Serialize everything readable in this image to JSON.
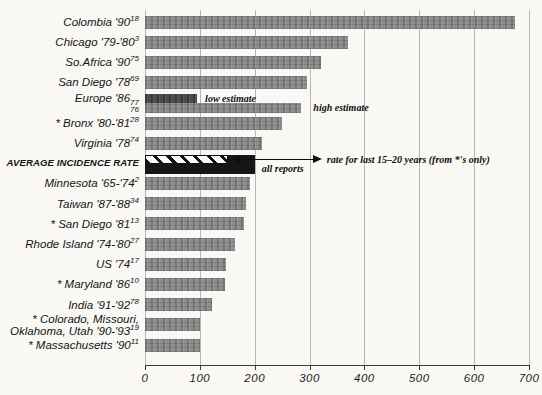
{
  "chart_data": {
    "type": "bar",
    "orientation": "horizontal",
    "title": "",
    "xlabel": "",
    "ylabel": "",
    "axis": {
      "min": 0,
      "max": 700,
      "ticks": [
        "0",
        "100",
        "200",
        "300",
        "400",
        "500",
        "600",
        "700"
      ],
      "grid": true
    },
    "rows": [
      {
        "label": "Colombia '90",
        "sup": "18",
        "value": 675,
        "style": "normal"
      },
      {
        "label": "Chicago '79-'80",
        "sup": "3",
        "value": 370,
        "style": "normal"
      },
      {
        "label": "So.Africa '90",
        "sup": "75",
        "value": 320,
        "style": "normal"
      },
      {
        "label": "San Diego '78",
        "sup": "69",
        "value": 295,
        "style": "normal"
      },
      {
        "label": "Europe '86",
        "sup": "77",
        "sub": "76",
        "bars": [
          {
            "name": "low estimate",
            "value": 95,
            "style": "dark"
          },
          {
            "name": "high estimate",
            "value": 285,
            "style": "normal"
          }
        ]
      },
      {
        "label": "* Bronx '80-'81",
        "sup": "28",
        "value": 250,
        "style": "normal"
      },
      {
        "label": "Virginia '78",
        "sup": "74",
        "value": 213,
        "style": "normal"
      },
      {
        "label": "AVERAGE INCIDENCE RATE",
        "emphasis": true,
        "bars": [
          {
            "name": "rate for last 15–20 years (from *'s only)",
            "value": 151,
            "style": "hatched"
          },
          {
            "name": "all reports",
            "value": 200,
            "style": "black"
          }
        ]
      },
      {
        "label": "Minnesota '65-'74",
        "sup": "2",
        "value": 191,
        "style": "normal"
      },
      {
        "label": "Taiwan '87-'88",
        "sup": "34",
        "value": 185,
        "style": "normal"
      },
      {
        "label": "* San Diego '81",
        "sup": "13",
        "value": 181,
        "style": "normal"
      },
      {
        "label": "Rhode Island '74-'80",
        "sup": "27",
        "value": 164,
        "style": "normal"
      },
      {
        "label": "US '74",
        "sup": "17",
        "value": 148,
        "style": "normal"
      },
      {
        "label": "* Maryland '86",
        "sup": "10",
        "value": 145,
        "style": "normal"
      },
      {
        "label": "India '91-'92",
        "sup": "78",
        "value": 122,
        "style": "normal"
      },
      {
        "label": "* Colorado, Missouri,\nOklahoma, Utah '90-'93",
        "sup": "19",
        "value": 101,
        "style": "normal"
      },
      {
        "label": "* Massachusetts '90",
        "sup": "11",
        "value": 100,
        "style": "normal"
      }
    ],
    "annotations": {
      "low_estimate": "low estimate",
      "high_estimate": "high estimate",
      "all_reports": "all reports",
      "arrow_note": "rate for last 15–20 years (from *'s only)"
    },
    "colors": {
      "bar": "#8e8e8e",
      "bar_dark": "#4c4c4c",
      "bar_black": "#161616",
      "background": "#f9f8f4",
      "gridline": "#b9b7b0"
    }
  }
}
